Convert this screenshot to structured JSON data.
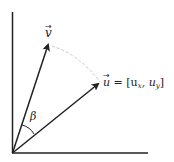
{
  "diagram": {
    "type": "vector-angle",
    "vectors": [
      {
        "name": "v",
        "label": "v",
        "arrow_glyph": "→"
      },
      {
        "name": "u",
        "label_vec": "u",
        "label_rest": " = [u",
        "sub_x": "x",
        "sep": ", u",
        "sub_y": "y",
        "close": "]"
      }
    ],
    "angle_label": "β",
    "colors": {
      "axis": "#222222",
      "vector": "#222222",
      "arc": "#cccccc",
      "background": "#ffffff"
    }
  }
}
